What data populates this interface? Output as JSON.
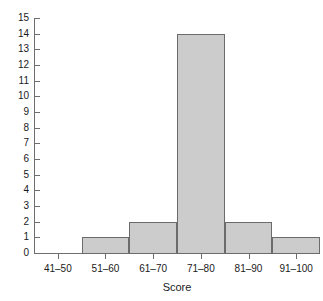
{
  "chart_data": {
    "type": "bar",
    "title": "",
    "subtitle": "",
    "xlabel": "Score",
    "ylabel": "",
    "categories": [
      "41–50",
      "51–60",
      "61–70",
      "71–80",
      "81–90",
      "91–100"
    ],
    "values": [
      0,
      1,
      2,
      14,
      2,
      1
    ],
    "ylim": [
      0,
      15
    ],
    "xlim": [
      0,
      6
    ],
    "y_ticks": [
      0,
      1,
      2,
      3,
      4,
      5,
      6,
      7,
      8,
      9,
      10,
      11,
      12,
      13,
      14,
      15
    ],
    "y_tick_labels": [
      "0",
      "1",
      "2",
      "3",
      "4",
      "5",
      "6",
      "7",
      "8",
      "9",
      "10",
      "11",
      "12",
      "13",
      "14",
      "15"
    ],
    "grid": false,
    "legend": false,
    "legend_position": "none",
    "bar_fill_color": "#cccccc",
    "bar_border_color": "#6b6b6b",
    "axis_color": "#6e6e6e",
    "background_color": "#ffffff",
    "text_color": "#1a1a1a"
  }
}
